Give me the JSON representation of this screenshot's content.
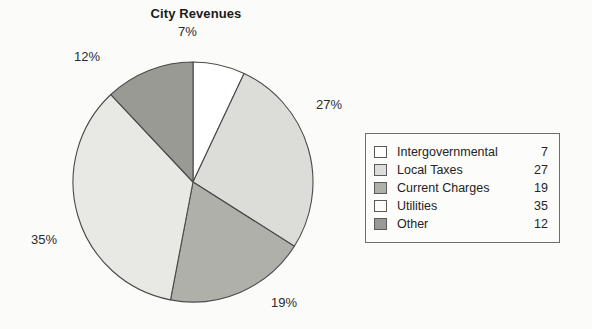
{
  "chart_data": {
    "type": "pie",
    "title": "City Revenues",
    "categories": [
      "Intergovernmental",
      "Local Taxes",
      "Current Charges",
      "Utilities",
      "Other"
    ],
    "values": [
      7,
      27,
      19,
      35,
      12
    ],
    "value_labels": [
      "7%",
      "27%",
      "19%",
      "35%",
      "12%"
    ],
    "legend_values": [
      "7",
      "27",
      "19",
      "35",
      "12"
    ],
    "slice_colors": [
      "#ffffff",
      "#dcdcd8",
      "#b0b0ab",
      "#e8e8e4",
      "#9a9a95"
    ],
    "slice_border_color": "#4a4a4a",
    "start_angle_deg": 0,
    "direction": "clockwise",
    "legend_position": "right",
    "grid": false,
    "xlabel": "",
    "ylabel": ""
  },
  "legend": {
    "items": [
      {
        "label": "Intergovernmental",
        "value": "7",
        "swatch": "#ffffff"
      },
      {
        "label": "Local Taxes",
        "value": "27",
        "swatch": "#dcdcd8"
      },
      {
        "label": "Current Charges",
        "value": "19",
        "swatch": "#b0b0ab"
      },
      {
        "label": "Utilities",
        "value": "35",
        "swatch": "#fcfcfa"
      },
      {
        "label": "Other",
        "value": "12",
        "swatch": "#9a9a95"
      }
    ]
  }
}
